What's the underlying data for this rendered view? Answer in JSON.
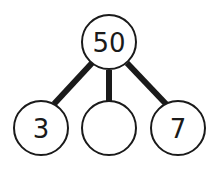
{
  "diagram": {
    "type": "number-bond",
    "whole": {
      "label": "50"
    },
    "parts": [
      {
        "label": "3"
      },
      {
        "label": ""
      },
      {
        "label": "7"
      }
    ]
  }
}
